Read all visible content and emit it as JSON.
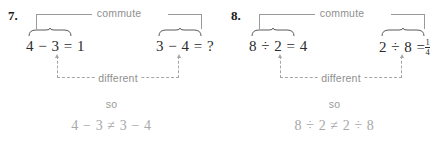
{
  "worksheet": {
    "problems": [
      {
        "number": "7.",
        "commute_label": "commute",
        "different_label": "different",
        "so_label": "so",
        "left_expression": "4 − 3 = 1",
        "right_expression": "3 − 4 = ?",
        "right_has_fraction": false,
        "conclusion": "4 − 3 ≠ 3 − 4"
      },
      {
        "number": "8.",
        "commute_label": "commute",
        "different_label": "different",
        "so_label": "so",
        "left_expression": "8 ÷ 2 = 4",
        "right_expression_prefix": "2 ÷ 8 =",
        "right_fraction_numerator": "1",
        "right_fraction_denominator": "4",
        "right_has_fraction": true,
        "conclusion": "8 ÷ 2 ≠ 2 ÷ 8"
      }
    ],
    "colors": {
      "background": "#ffffff",
      "equation_text": "#2b2b2b",
      "label_text": "#8f8f8f",
      "connector_line": "#9a9a9a",
      "dashed_line": "#a6a6a6",
      "conclusion_text": "#a8a8a8",
      "problem_number": "#1a1a1a"
    }
  }
}
